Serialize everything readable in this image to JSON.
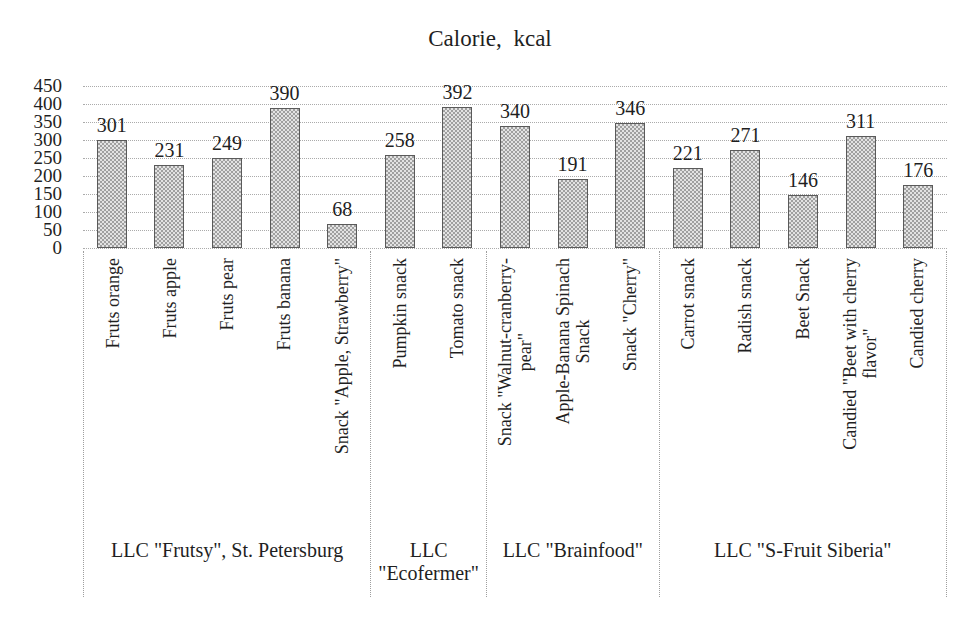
{
  "title": "Calorie, kcal",
  "chart_data": {
    "type": "bar",
    "title": "Calorie, kcal",
    "ylabel": "",
    "xlabel": "",
    "ylim": [
      0,
      450
    ],
    "yticks": [
      450,
      400,
      350,
      300,
      250,
      200,
      150,
      100,
      50,
      0
    ],
    "grid": "horizontal-dotted",
    "legend": "none",
    "bar_fill": "gray-checker-pattern",
    "bar_border_color": "#5a5a5a",
    "bar_pattern_color": "#a0a0a0",
    "bar_base_color": "#e3e3e3",
    "gridline_color": "#ababab",
    "groups": [
      {
        "label": "LLC \"Frutsy\", St. Petersburg",
        "items": [
          {
            "label": "Fruts orange",
            "value": 301
          },
          {
            "label": "Fruts apple",
            "value": 231
          },
          {
            "label": "Fruts pear",
            "value": 249
          },
          {
            "label": "Fruts banana",
            "value": 390
          },
          {
            "label": "Snack \"Apple, Strawberry\"",
            "value": 68
          }
        ]
      },
      {
        "label": "LLC\n\"Ecofermer\"",
        "items": [
          {
            "label": "Pumpkin snack",
            "value": 258
          },
          {
            "label": "Tomato snack",
            "value": 392
          }
        ]
      },
      {
        "label": "LLC \"Brainfood\"",
        "items": [
          {
            "label": "Snack \"Walnut-cranberry-\npear\"",
            "value": 340
          },
          {
            "label": "Apple-Banana Spinach\nSnack",
            "value": 191
          },
          {
            "label": "Snack \"Cherry\"",
            "value": 346
          }
        ]
      },
      {
        "label": "LLC \"S-Fruit Siberia\"",
        "items": [
          {
            "label": "Carrot snack",
            "value": 221
          },
          {
            "label": "Radish snack",
            "value": 271
          },
          {
            "label": "Beet Snack",
            "value": 146
          },
          {
            "label": "Candied \"Beet with cherry\nflavor\"",
            "value": 311
          },
          {
            "label": "Candied cherry",
            "value": 176
          }
        ]
      }
    ]
  }
}
